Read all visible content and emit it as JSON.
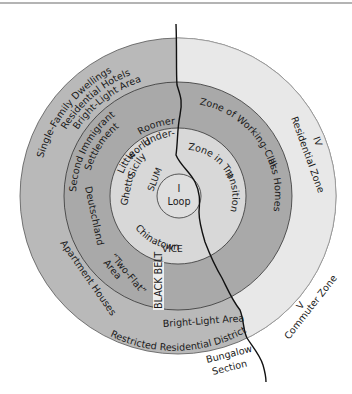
{
  "diagram": {
    "colors": {
      "outer_left": "#b9b9b9",
      "outer_right": "#e8e8e8",
      "zone_iii": "#a9a9a9",
      "zone_ii": "#d8d8d8",
      "loop": "#dedede",
      "black_belt": "#eeeeee",
      "stroke": "#1a1a1a",
      "rule": "#6b6b6b"
    },
    "zones": {
      "loop": {
        "numeral": "I",
        "label": "Loop"
      },
      "zone_ii": {
        "numeral": "II",
        "label": "Zone in Transition"
      },
      "zone_iii": {
        "numeral": "III",
        "label": "Zone of Working-Class Homes"
      },
      "zone_iv": {
        "numeral": "IV",
        "label": "Residential Zone"
      },
      "zone_v": {
        "numeral": "V",
        "label": "Commuter Zone"
      }
    },
    "labels": {
      "single_family": "Single-Family Dwellings",
      "residential_hotels": "Residential Hotels",
      "bright_light_top": "Bright-Light Area",
      "second_immigrant": "Second Immigrant",
      "settlement": "Settlement",
      "roomers": "Roomers",
      "under": "Under-",
      "world": "world",
      "little": "Little",
      "sicily": "Sicily",
      "ghetto": "Ghetto",
      "slum": "SLUM",
      "chinatown": "Chinatown",
      "vice": "VICE",
      "deutschland": "Deutschland",
      "two_flat": "“Two-Flat”",
      "area": "Area",
      "black_belt": "BLACK BELT",
      "apartment_houses": "Apartment Houses",
      "bright_light_bottom": "Bright-Light Area",
      "restricted": "Restricted Residential District",
      "bungalow": "Bungalow",
      "section": "Section"
    }
  }
}
